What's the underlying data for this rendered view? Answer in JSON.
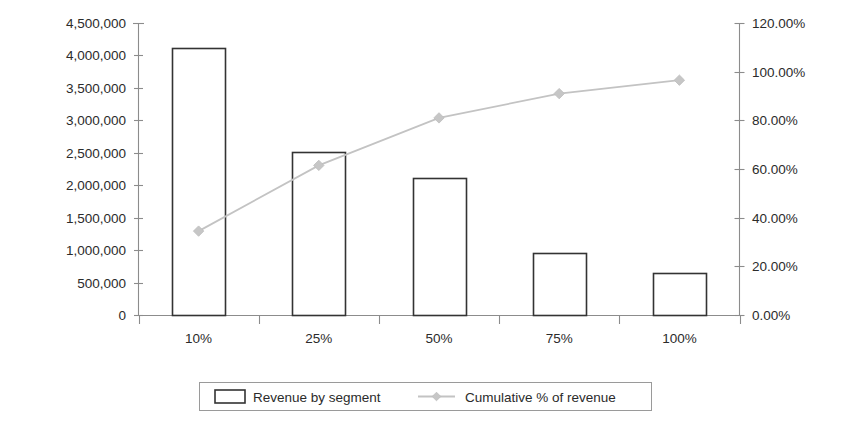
{
  "chart_data": {
    "type": "bar",
    "title": "",
    "subtitle": "",
    "xlabel": "",
    "ylabel": "",
    "categories": [
      "10%",
      "25%",
      "50%",
      "75%",
      "100%"
    ],
    "series": [
      {
        "name": "Revenue by segment",
        "type": "bar",
        "axis": "left",
        "values": [
          4110000,
          2510000,
          2110000,
          955000,
          645000
        ]
      },
      {
        "name": "Cumulative % of revenue",
        "type": "line",
        "axis": "right",
        "values": [
          34.5,
          61.5,
          81.0,
          91.0,
          96.5
        ]
      }
    ],
    "left_axis": {
      "label": "",
      "ylim": [
        0,
        4500000
      ],
      "tick_values": [
        0,
        500000,
        1000000,
        1500000,
        2000000,
        2500000,
        3000000,
        3500000,
        4000000,
        4500000
      ],
      "tick_labels": [
        "0",
        "500,000",
        "1,000,000",
        "1,500,000",
        "2,000,000",
        "2,500,000",
        "3,000,000",
        "3,500,000",
        "4,000,000",
        "4,500,000"
      ]
    },
    "right_axis": {
      "label": "",
      "ylim": [
        0,
        120
      ],
      "tick_values": [
        0,
        20,
        40,
        60,
        80,
        100,
        120
      ],
      "tick_labels": [
        "0.00%",
        "20.00%",
        "40.00%",
        "60.00%",
        "80.00%",
        "100.00%",
        "120.00%"
      ]
    },
    "grid": false,
    "legend": {
      "position": "bottom",
      "entries": [
        {
          "label": "Revenue by segment",
          "marker": "open-rectangle",
          "color": "#ffffff",
          "border": "#333333"
        },
        {
          "label": "Cumulative % of revenue",
          "marker": "line-with-diamond",
          "color": "#c3c3c3"
        }
      ]
    },
    "colors": {
      "bar_fill": "#ffffff",
      "bar_stroke": "#333333",
      "line": "#c3c3c3",
      "marker": "#c6c6c6",
      "axis": "#8c8c8c",
      "text": "#2b2b2b",
      "background": "#ffffff"
    }
  }
}
